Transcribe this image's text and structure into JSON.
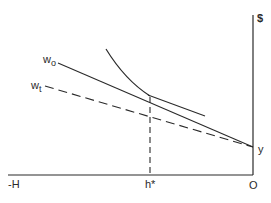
{
  "diagram": {
    "type": "economics-labor-leisure",
    "axes": {
      "vertical_label": "$",
      "origin_label": "O",
      "left_end_label": "-H",
      "hours_marker_label": "h*"
    },
    "lines": {
      "w0": {
        "label_main": "w",
        "label_sub": "o",
        "style": "solid"
      },
      "wt": {
        "label_main": "w",
        "label_sub": "t",
        "style": "dashed"
      }
    },
    "intercept_label": "y",
    "colors": {
      "ink": "#2a2a2a",
      "background": "#ffffff"
    }
  }
}
